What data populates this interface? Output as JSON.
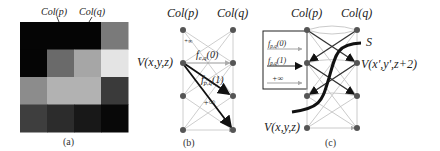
{
  "figure": {
    "panels": [
      {
        "id": "a",
        "caption": "(a)",
        "column_labels": [
          "Col(p)",
          "Col(q)"
        ],
        "grid": {
          "rows": 4,
          "cols": 4,
          "gray_values": [
            [
              "#050505",
              "#050505",
              "#050505",
              "#7a7a7a"
            ],
            [
              "#050505",
              "#6a6a6a",
              "#a6a6a6",
              "#e4e4e4"
            ],
            [
              "#8c8c8c",
              "#b2b2b2",
              "#b2b2b2",
              "#3a3a3a"
            ],
            [
              "#3e3e3e",
              "#2c2c2c",
              "#181818",
              "#080808"
            ]
          ]
        }
      },
      {
        "id": "b",
        "caption": "(b)",
        "column_labels": [
          "Col(p)",
          "Col(q)"
        ],
        "node_label": "V(x,y,z)",
        "edge_labels": [
          "f_{e,q}(0)",
          "f_{p,q}(1)",
          "+∞"
        ],
        "small_label": "+∞"
      },
      {
        "id": "c",
        "caption": "(c)",
        "column_labels": [
          "Col(p)",
          "Col(q)"
        ],
        "node_labels": [
          "V(x',y',z+2)",
          "V(x,y,z)"
        ],
        "cut_label": "S",
        "legend": [
          {
            "label": "f_{p,q}(0)",
            "style": "light"
          },
          {
            "label": "f_{p,q}(1)",
            "style": "dark"
          },
          {
            "label": "+∞",
            "style": "light"
          }
        ]
      }
    ]
  }
}
